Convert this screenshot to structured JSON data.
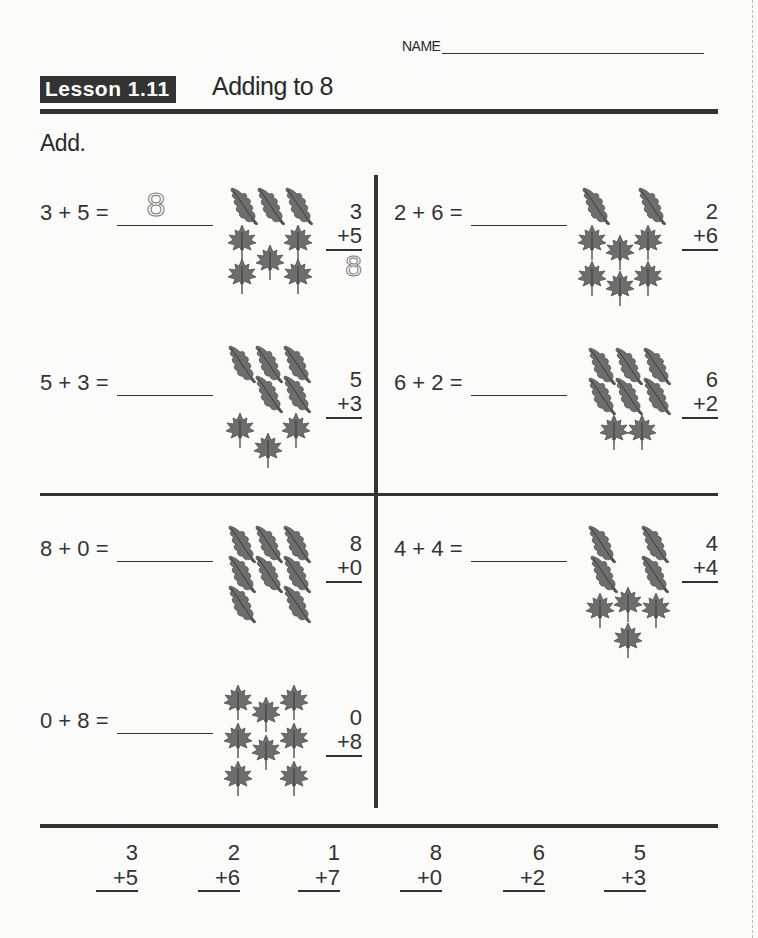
{
  "header": {
    "name_label": "NAME",
    "lesson_badge": "Lesson 1.11",
    "title": "Adding to 8",
    "instruction": "Add."
  },
  "problems": [
    {
      "id": "p1",
      "horizontal": "3 + 5 =",
      "answer": "8",
      "top": "3",
      "bottom": "+5",
      "vertical_answer": "8",
      "leaves": {
        "oak": 3,
        "maple": 5
      }
    },
    {
      "id": "p2",
      "horizontal": "2 + 6 =",
      "answer": "",
      "top": "2",
      "bottom": "+6",
      "vertical_answer": "",
      "leaves": {
        "oak": 2,
        "maple": 6
      }
    },
    {
      "id": "p3",
      "horizontal": "5 + 3 =",
      "answer": "",
      "top": "5",
      "bottom": "+3",
      "vertical_answer": "",
      "leaves": {
        "oak": 5,
        "maple": 3
      }
    },
    {
      "id": "p4",
      "horizontal": "6 + 2 =",
      "answer": "",
      "top": "6",
      "bottom": "+2",
      "vertical_answer": "",
      "leaves": {
        "oak": 6,
        "maple": 2
      }
    },
    {
      "id": "p5",
      "horizontal": "8 + 0 =",
      "answer": "",
      "top": "8",
      "bottom": "+0",
      "vertical_answer": "",
      "leaves": {
        "oak": 8,
        "maple": 0
      }
    },
    {
      "id": "p6",
      "horizontal": "4 + 4 =",
      "answer": "",
      "top": "4",
      "bottom": "+4",
      "vertical_answer": "",
      "leaves": {
        "oak": 4,
        "maple": 4
      }
    },
    {
      "id": "p7",
      "horizontal": "0 + 8 =",
      "answer": "",
      "top": "0",
      "bottom": "+8",
      "vertical_answer": "",
      "leaves": {
        "oak": 0,
        "maple": 8
      }
    }
  ],
  "bottom_row": [
    {
      "top": "3",
      "bottom": "+5"
    },
    {
      "top": "2",
      "bottom": "+6"
    },
    {
      "top": "1",
      "bottom": "+7"
    },
    {
      "top": "8",
      "bottom": "+0"
    },
    {
      "top": "6",
      "bottom": "+2"
    },
    {
      "top": "5",
      "bottom": "+3"
    }
  ],
  "colors": {
    "ink": "#333333",
    "leaf": "#6e6e6e",
    "paper": "#fbfbfa"
  }
}
